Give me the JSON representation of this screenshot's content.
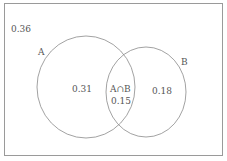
{
  "diagram": {
    "type": "venn",
    "universe_value": "0.36",
    "sets": [
      {
        "label": "A",
        "only_value": "0.31"
      },
      {
        "label": "B",
        "only_value": "0.18"
      }
    ],
    "intersection": {
      "label": "A∩B",
      "value": "0.15"
    },
    "colors": {
      "stroke": "#8a8a8a",
      "frame": "#9a9a9a",
      "text": "#555555"
    }
  }
}
